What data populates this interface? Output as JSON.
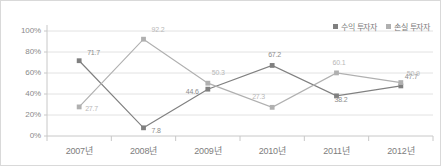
{
  "chart_data": {
    "type": "line",
    "title": "",
    "xlabel": "",
    "ylabel": "",
    "ylim": [
      0,
      100
    ],
    "grid": true,
    "legend_position": "top-right",
    "categories": [
      "2007년",
      "2008년",
      "2009년",
      "2010년",
      "2011년",
      "2012년"
    ],
    "ytick_labels": [
      "100%",
      "80%",
      "60%",
      "40%",
      "20%",
      "0%"
    ],
    "ytick_values": [
      100,
      80,
      60,
      40,
      20,
      0
    ],
    "series": [
      {
        "name": "수익 투자자",
        "color": "#808080",
        "values": [
          71.7,
          7.8,
          44.6,
          67.2,
          38.2,
          47.7
        ],
        "labels": [
          "71.7",
          "7.8",
          "44.6",
          "67.2",
          "38.2",
          "47.7"
        ]
      },
      {
        "name": "손실 투자자",
        "color": "#b0b0b0",
        "values": [
          27.7,
          92.2,
          50.3,
          27.3,
          60.1,
          50.9
        ],
        "labels": [
          "27.7",
          "92.2",
          "50.3",
          "27.3",
          "60.1",
          "50.9"
        ]
      }
    ]
  },
  "legend": {
    "items": [
      {
        "label": "수익 투자자",
        "color": "#808080"
      },
      {
        "label": "손실 투자자",
        "color": "#b0b0b0"
      }
    ]
  },
  "colors": {
    "series_dark": "#808080",
    "series_light": "#b0b0b0",
    "grid": "#e2e2e2",
    "axis": "#c8c8c8",
    "frame": "#d9d9d9",
    "tick_text": "#8a8a8a"
  }
}
